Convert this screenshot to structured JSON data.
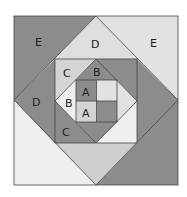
{
  "colors": {
    "dark": "#8c8c8c",
    "medium": "#a8a8a8",
    "light": "#d4d4d4",
    "lighter": "#e2e2e2",
    "lightest": "#efefef",
    "stroke": "#333333"
  },
  "labels": {
    "outer_tl": "E",
    "outer_tr": "E",
    "diamond_top": "D",
    "diamond_left": "D",
    "middle_tl": "C",
    "middle_bl": "C",
    "inner_top": "B",
    "inner_left": "B",
    "grid_tl": "A",
    "grid_bl": "A"
  }
}
